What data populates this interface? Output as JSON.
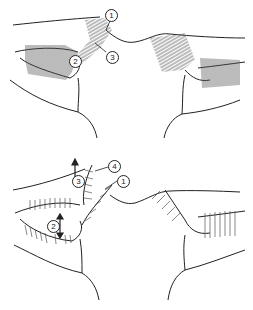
{
  "figure": {
    "panels": [
      {
        "id": "top",
        "callouts": [
          {
            "label": "1",
            "x": 105,
            "y": 9
          },
          {
            "label": "2",
            "x": 69,
            "y": 55
          },
          {
            "label": "3",
            "x": 106,
            "y": 51
          }
        ]
      },
      {
        "id": "bottom",
        "callouts": [
          {
            "label": "3",
            "x": 72,
            "y": 20
          },
          {
            "label": "4",
            "x": 108,
            "y": 5
          },
          {
            "label": "1",
            "x": 117,
            "y": 20
          },
          {
            "label": "2",
            "x": 47,
            "y": 65
          }
        ],
        "arrows": [
          {
            "type": "up",
            "x": 75,
            "y": 8
          },
          {
            "type": "double-vertical",
            "x": 60,
            "y": 62
          }
        ]
      }
    ],
    "colors": {
      "line": "#222222",
      "hatch": "#555555",
      "background": "#ffffff"
    }
  }
}
